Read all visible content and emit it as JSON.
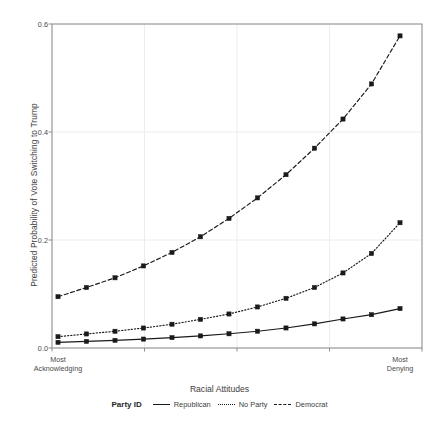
{
  "chart_data": {
    "type": "line",
    "title": "",
    "xlabel": "Racial Attitudes",
    "ylabel": "Predicted Probability of Vote Switching to Trump",
    "ylim": [
      0.0,
      0.6
    ],
    "yticks": [
      "0.0",
      "0.2",
      "0.4",
      "0.6"
    ],
    "ytick_values": [
      0.0,
      0.2,
      0.4,
      0.6
    ],
    "grid": true,
    "legend_position": "bottom",
    "legend_title": "Party ID",
    "x_axis_left_label": "Most Acknowledging",
    "x_axis_right_label": "Most Denying",
    "x_tick_count": 5,
    "x": [
      0,
      1,
      2,
      3,
      4,
      5,
      6,
      7,
      8,
      9,
      10,
      11,
      12
    ],
    "series": [
      {
        "name": "Democrat",
        "style": "dashed",
        "color": "#1a1a1a",
        "values": [
          0.095,
          0.112,
          0.13,
          0.152,
          0.177,
          0.206,
          0.24,
          0.278,
          0.321,
          0.37,
          0.424,
          0.489,
          0.578
        ]
      },
      {
        "name": "No Party",
        "style": "dotted",
        "color": "#1a1a1a",
        "values": [
          0.021,
          0.026,
          0.031,
          0.037,
          0.044,
          0.053,
          0.063,
          0.076,
          0.092,
          0.112,
          0.139,
          0.175,
          0.232
        ]
      },
      {
        "name": "Republican",
        "style": "solid",
        "color": "#1a1a1a",
        "values": [
          0.0105,
          0.0122,
          0.0142,
          0.0165,
          0.0192,
          0.0224,
          0.0263,
          0.0311,
          0.0371,
          0.0447,
          0.0538,
          0.0617,
          0.073
        ]
      }
    ]
  },
  "legend": {
    "title": "Party ID",
    "entries": [
      {
        "label": "Republican",
        "style": "solid"
      },
      {
        "label": "No Party",
        "style": "dotted"
      },
      {
        "label": "Democrat",
        "style": "dashed"
      }
    ]
  },
  "axes": {
    "y_title": "Predicted Probability of Vote Switching to Trump",
    "x_title": "Racial Attitudes",
    "x_left_line1": "Most",
    "x_left_line2": "Acknowledging",
    "x_right_line1": "Most",
    "x_right_line2": "Denying"
  },
  "colors": {
    "line": "#1a1a1a",
    "grid": "#ececec",
    "frame": "#8c8c8c",
    "text": "#3d3d3d",
    "background": "#ffffff"
  }
}
